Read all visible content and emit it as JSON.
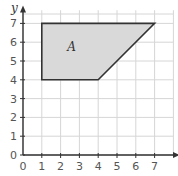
{
  "diagram": {
    "type": "coordinate-grid-shape",
    "x_axis": {
      "label": "x",
      "ticks": [
        "0",
        "1",
        "2",
        "3",
        "4",
        "5",
        "6",
        "7"
      ]
    },
    "y_axis": {
      "label": "y",
      "ticks": [
        "0",
        "1",
        "2",
        "3",
        "4",
        "5",
        "6",
        "7"
      ]
    },
    "shape": {
      "label": "A",
      "vertices": [
        [
          1,
          4
        ],
        [
          1,
          7
        ],
        [
          7,
          7
        ],
        [
          4,
          4
        ]
      ],
      "fill": "#d9d9d9",
      "stroke": "#333333"
    },
    "grid_color": "#d6d6d6",
    "axis_color": "#333333"
  }
}
